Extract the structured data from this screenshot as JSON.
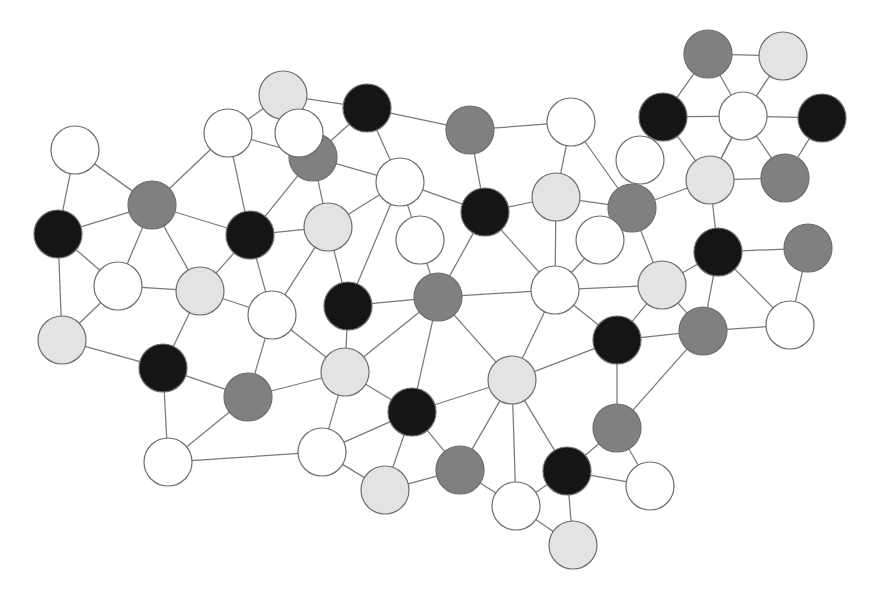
{
  "figure": {
    "type": "node-link-network-graph",
    "title": "",
    "width": 877,
    "height": 603,
    "background": "#ffffff",
    "node_radius": 24,
    "edge_color": "#7a7a7a",
    "edge_width": 1.25,
    "node_stroke": "#6e6e6e",
    "node_stroke_width": 1.2,
    "node_count": 53,
    "edge_count": 92
  },
  "legend": {
    "categories": [
      {
        "key": "white",
        "label": "white",
        "color": "#ffffff"
      },
      {
        "key": "light",
        "label": "light gray",
        "color": "#e3e3e3"
      },
      {
        "key": "mid",
        "label": "medium gray",
        "color": "#808080"
      },
      {
        "key": "black",
        "label": "black",
        "color": "#151515"
      }
    ]
  },
  "chart_data": {
    "type": "scatter",
    "title": "",
    "xlabel": "",
    "ylabel": "",
    "xlim": [
      0,
      877
    ],
    "ylim": [
      0,
      603
    ],
    "grid": false,
    "legend_position": "none",
    "nodes": [
      {
        "id": "n0",
        "x": 75,
        "y": 150,
        "color": "white"
      },
      {
        "id": "n1",
        "x": 58,
        "y": 234,
        "color": "black"
      },
      {
        "id": "n2",
        "x": 152,
        "y": 205,
        "color": "mid"
      },
      {
        "id": "n3",
        "x": 118,
        "y": 286,
        "color": "white"
      },
      {
        "id": "n4",
        "x": 62,
        "y": 340,
        "color": "light"
      },
      {
        "id": "n5",
        "x": 163,
        "y": 368,
        "color": "black"
      },
      {
        "id": "n6",
        "x": 200,
        "y": 291,
        "color": "light"
      },
      {
        "id": "n7",
        "x": 228,
        "y": 133,
        "color": "white"
      },
      {
        "id": "n8",
        "x": 250,
        "y": 235,
        "color": "black"
      },
      {
        "id": "n9",
        "x": 283,
        "y": 95,
        "color": "light"
      },
      {
        "id": "n10",
        "x": 313,
        "y": 157,
        "color": "mid"
      },
      {
        "id": "n11",
        "x": 367,
        "y": 108,
        "color": "black"
      },
      {
        "id": "n12",
        "x": 328,
        "y": 227,
        "color": "light"
      },
      {
        "id": "n13",
        "x": 272,
        "y": 315,
        "color": "white"
      },
      {
        "id": "n14",
        "x": 248,
        "y": 397,
        "color": "mid"
      },
      {
        "id": "n15",
        "x": 348,
        "y": 306,
        "color": "black"
      },
      {
        "id": "n16",
        "x": 400,
        "y": 182,
        "color": "white"
      },
      {
        "id": "n17",
        "x": 470,
        "y": 130,
        "color": "mid"
      },
      {
        "id": "n18",
        "x": 485,
        "y": 212,
        "color": "black"
      },
      {
        "id": "n19",
        "x": 438,
        "y": 297,
        "color": "mid"
      },
      {
        "id": "n20",
        "x": 345,
        "y": 372,
        "color": "light"
      },
      {
        "id": "n21",
        "x": 322,
        "y": 452,
        "color": "white"
      },
      {
        "id": "n22",
        "x": 412,
        "y": 412,
        "color": "black"
      },
      {
        "id": "n23",
        "x": 385,
        "y": 490,
        "color": "light"
      },
      {
        "id": "n24",
        "x": 460,
        "y": 470,
        "color": "mid"
      },
      {
        "id": "n25",
        "x": 512,
        "y": 380,
        "color": "light"
      },
      {
        "id": "n26",
        "x": 516,
        "y": 506,
        "color": "white"
      },
      {
        "id": "n27",
        "x": 567,
        "y": 471,
        "color": "black"
      },
      {
        "id": "n28",
        "x": 573,
        "y": 545,
        "color": "light"
      },
      {
        "id": "n29",
        "x": 555,
        "y": 290,
        "color": "white"
      },
      {
        "id": "n30",
        "x": 556,
        "y": 197,
        "color": "light"
      },
      {
        "id": "n31",
        "x": 571,
        "y": 122,
        "color": "white"
      },
      {
        "id": "n32",
        "x": 632,
        "y": 208,
        "color": "mid"
      },
      {
        "id": "n33",
        "x": 617,
        "y": 340,
        "color": "black"
      },
      {
        "id": "n34",
        "x": 617,
        "y": 428,
        "color": "mid"
      },
      {
        "id": "n35",
        "x": 650,
        "y": 486,
        "color": "white"
      },
      {
        "id": "n36",
        "x": 662,
        "y": 285,
        "color": "light"
      },
      {
        "id": "n37",
        "x": 718,
        "y": 252,
        "color": "black"
      },
      {
        "id": "n38",
        "x": 703,
        "y": 331,
        "color": "mid"
      },
      {
        "id": "n39",
        "x": 790,
        "y": 325,
        "color": "white"
      },
      {
        "id": "n40",
        "x": 808,
        "y": 248,
        "color": "mid"
      },
      {
        "id": "n41",
        "x": 710,
        "y": 180,
        "color": "light"
      },
      {
        "id": "n42",
        "x": 708,
        "y": 54,
        "color": "mid"
      },
      {
        "id": "n43",
        "x": 783,
        "y": 56,
        "color": "light"
      },
      {
        "id": "n44",
        "x": 663,
        "y": 117,
        "color": "black"
      },
      {
        "id": "n45",
        "x": 743,
        "y": 116,
        "color": "white"
      },
      {
        "id": "n46",
        "x": 822,
        "y": 118,
        "color": "black"
      },
      {
        "id": "n47",
        "x": 785,
        "y": 178,
        "color": "mid"
      },
      {
        "id": "n48",
        "x": 168,
        "y": 462,
        "color": "white"
      },
      {
        "id": "n49",
        "x": 299,
        "y": 133,
        "color": "white"
      },
      {
        "id": "n50",
        "x": 420,
        "y": 240,
        "color": "white"
      },
      {
        "id": "n51",
        "x": 640,
        "y": 160,
        "color": "white"
      },
      {
        "id": "n52",
        "x": 600,
        "y": 240,
        "color": "white"
      }
    ],
    "edges": [
      [
        "n0",
        "n1"
      ],
      [
        "n0",
        "n2"
      ],
      [
        "n1",
        "n2"
      ],
      [
        "n1",
        "n3"
      ],
      [
        "n1",
        "n4"
      ],
      [
        "n2",
        "n3"
      ],
      [
        "n2",
        "n6"
      ],
      [
        "n2",
        "n7"
      ],
      [
        "n2",
        "n8"
      ],
      [
        "n3",
        "n6"
      ],
      [
        "n3",
        "n4"
      ],
      [
        "n4",
        "n5"
      ],
      [
        "n5",
        "n6"
      ],
      [
        "n5",
        "n14"
      ],
      [
        "n5",
        "n48"
      ],
      [
        "n6",
        "n8"
      ],
      [
        "n6",
        "n13"
      ],
      [
        "n7",
        "n9"
      ],
      [
        "n7",
        "n10"
      ],
      [
        "n7",
        "n8"
      ],
      [
        "n8",
        "n10"
      ],
      [
        "n8",
        "n12"
      ],
      [
        "n8",
        "n13"
      ],
      [
        "n9",
        "n10"
      ],
      [
        "n9",
        "n11"
      ],
      [
        "n10",
        "n11"
      ],
      [
        "n10",
        "n12"
      ],
      [
        "n10",
        "n16"
      ],
      [
        "n11",
        "n16"
      ],
      [
        "n11",
        "n17"
      ],
      [
        "n12",
        "n13"
      ],
      [
        "n12",
        "n15"
      ],
      [
        "n12",
        "n16"
      ],
      [
        "n13",
        "n14"
      ],
      [
        "n13",
        "n20"
      ],
      [
        "n14",
        "n20"
      ],
      [
        "n14",
        "n48"
      ],
      [
        "n15",
        "n19"
      ],
      [
        "n15",
        "n20"
      ],
      [
        "n15",
        "n16"
      ],
      [
        "n16",
        "n18"
      ],
      [
        "n16",
        "n19"
      ],
      [
        "n17",
        "n18"
      ],
      [
        "n17",
        "n31"
      ],
      [
        "n18",
        "n19"
      ],
      [
        "n18",
        "n29"
      ],
      [
        "n18",
        "n30"
      ],
      [
        "n19",
        "n20"
      ],
      [
        "n19",
        "n22"
      ],
      [
        "n19",
        "n25"
      ],
      [
        "n19",
        "n29"
      ],
      [
        "n20",
        "n21"
      ],
      [
        "n20",
        "n22"
      ],
      [
        "n21",
        "n22"
      ],
      [
        "n21",
        "n23"
      ],
      [
        "n21",
        "n48"
      ],
      [
        "n22",
        "n23"
      ],
      [
        "n22",
        "n24"
      ],
      [
        "n22",
        "n25"
      ],
      [
        "n23",
        "n24"
      ],
      [
        "n24",
        "n25"
      ],
      [
        "n24",
        "n26"
      ],
      [
        "n25",
        "n26"
      ],
      [
        "n25",
        "n27"
      ],
      [
        "n25",
        "n29"
      ],
      [
        "n25",
        "n33"
      ],
      [
        "n26",
        "n27"
      ],
      [
        "n26",
        "n28"
      ],
      [
        "n27",
        "n28"
      ],
      [
        "n27",
        "n34"
      ],
      [
        "n27",
        "n35"
      ],
      [
        "n29",
        "n30"
      ],
      [
        "n29",
        "n32"
      ],
      [
        "n29",
        "n33"
      ],
      [
        "n29",
        "n36"
      ],
      [
        "n30",
        "n31"
      ],
      [
        "n30",
        "n32"
      ],
      [
        "n31",
        "n32"
      ],
      [
        "n32",
        "n36"
      ],
      [
        "n32",
        "n41"
      ],
      [
        "n33",
        "n34"
      ],
      [
        "n33",
        "n36"
      ],
      [
        "n33",
        "n38"
      ],
      [
        "n34",
        "n35"
      ],
      [
        "n34",
        "n38"
      ],
      [
        "n36",
        "n37"
      ],
      [
        "n36",
        "n38"
      ],
      [
        "n37",
        "n38"
      ],
      [
        "n37",
        "n40"
      ],
      [
        "n37",
        "n41"
      ],
      [
        "n37",
        "n39"
      ],
      [
        "n38",
        "n39"
      ],
      [
        "n39",
        "n40"
      ],
      [
        "n41",
        "n44"
      ],
      [
        "n41",
        "n45"
      ],
      [
        "n42",
        "n43"
      ],
      [
        "n42",
        "n44"
      ],
      [
        "n42",
        "n45"
      ],
      [
        "n43",
        "n45"
      ],
      [
        "n44",
        "n45"
      ],
      [
        "n45",
        "n46"
      ],
      [
        "n45",
        "n47"
      ],
      [
        "n45",
        "n41"
      ],
      [
        "n46",
        "n47"
      ],
      [
        "n47",
        "n41"
      ]
    ]
  }
}
